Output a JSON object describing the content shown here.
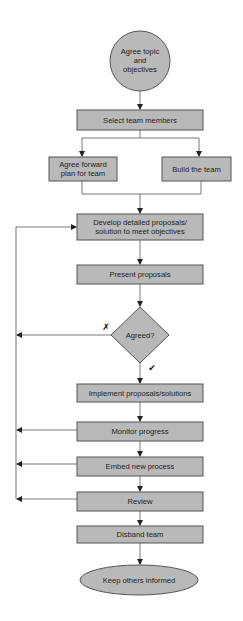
{
  "diagram": {
    "type": "flowchart",
    "colors": {
      "node_fill": "#b9b9b9",
      "node_stroke": "#555555",
      "line": "#555555",
      "text": "#222222",
      "background": "#ffffff"
    },
    "nodes": {
      "start": {
        "shape": "circle",
        "lines": [
          "Agree topic",
          "and",
          "objectives"
        ]
      },
      "select_team": {
        "shape": "rect",
        "lines": [
          "Select team members"
        ]
      },
      "agree_plan": {
        "shape": "rect",
        "lines": [
          "Agree forward",
          "plan for team"
        ]
      },
      "build_team": {
        "shape": "rect",
        "lines": [
          "Build the team"
        ]
      },
      "develop": {
        "shape": "rect",
        "lines": [
          "Develop detailed proposals/",
          "solution to meet objectives"
        ]
      },
      "present": {
        "shape": "rect",
        "lines": [
          "Present proposals"
        ]
      },
      "decision": {
        "shape": "diamond",
        "lines": [
          "Agreed?"
        ]
      },
      "implement": {
        "shape": "rect",
        "lines": [
          "Implement proposals/solutions"
        ]
      },
      "monitor": {
        "shape": "rect",
        "lines": [
          "Monitor progress"
        ]
      },
      "embed": {
        "shape": "rect",
        "lines": [
          "Embed new process"
        ]
      },
      "review": {
        "shape": "rect",
        "lines": [
          "Review"
        ]
      },
      "disband": {
        "shape": "rect",
        "lines": [
          "Disband team"
        ]
      },
      "end": {
        "shape": "ellipse",
        "lines": [
          "Keep others informed"
        ]
      }
    },
    "decision_labels": {
      "no": "✗",
      "yes": "✔"
    },
    "edges": [
      {
        "from": "start",
        "to": "select_team"
      },
      {
        "from": "select_team",
        "to": "agree_plan"
      },
      {
        "from": "select_team",
        "to": "build_team"
      },
      {
        "from": "agree_plan",
        "to": "develop"
      },
      {
        "from": "build_team",
        "to": "develop"
      },
      {
        "from": "develop",
        "to": "present"
      },
      {
        "from": "present",
        "to": "decision"
      },
      {
        "from": "decision",
        "to": "implement",
        "label": "yes"
      },
      {
        "from": "decision",
        "to": "develop",
        "label": "no",
        "via": "left-loop"
      },
      {
        "from": "implement",
        "to": "monitor"
      },
      {
        "from": "monitor",
        "to": "embed"
      },
      {
        "from": "monitor",
        "to": "develop",
        "via": "left-loop"
      },
      {
        "from": "embed",
        "to": "review"
      },
      {
        "from": "embed",
        "to": "develop",
        "via": "left-loop"
      },
      {
        "from": "review",
        "to": "disband"
      },
      {
        "from": "review",
        "to": "develop",
        "via": "left-loop"
      },
      {
        "from": "disband",
        "to": "end"
      }
    ]
  }
}
